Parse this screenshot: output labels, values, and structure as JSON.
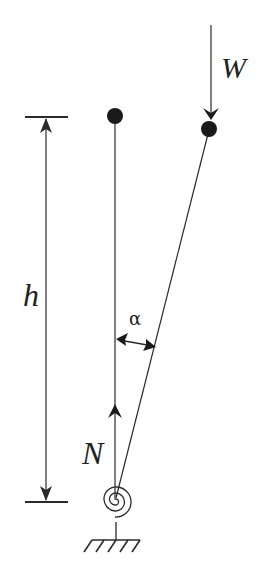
{
  "diagram": {
    "labels": {
      "load": "W",
      "height": "h",
      "angle": "α",
      "normal_force": "N"
    },
    "elements": [
      {
        "name": "vertical-reference-rod",
        "description": "Vertical (undeflected) position of rod"
      },
      {
        "name": "tilted-rod",
        "description": "Deflected rod at angle alpha"
      },
      {
        "name": "top-mass-vertical",
        "description": "Point mass at top of vertical rod"
      },
      {
        "name": "top-mass-tilted",
        "description": "Point mass at top of tilted rod"
      },
      {
        "name": "torsional-spring",
        "description": "Spiral spring at base"
      },
      {
        "name": "ground-support",
        "description": "Fixed ground hatching"
      },
      {
        "name": "height-dimension",
        "description": "Dimension line showing h"
      },
      {
        "name": "load-arrow",
        "description": "Vertical load W"
      },
      {
        "name": "normal-force-arrow",
        "description": "Upward reaction N"
      },
      {
        "name": "angle-arrow",
        "description": "Double-headed arrow showing alpha"
      }
    ],
    "colors": {
      "stroke": "#2a2a2a",
      "background": "#ffffff"
    }
  }
}
